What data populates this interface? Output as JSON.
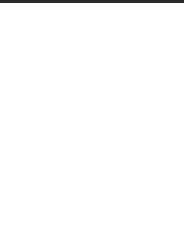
{
  "fret_label": "5 tr",
  "colors": {
    "line": "#7a7a7a",
    "dot": "#2b2b2b",
    "band": "#2a2a2a",
    "box": "#777777"
  },
  "grid": {
    "strings_x": [
      16,
      44.5,
      73,
      101.5,
      130,
      158.5
    ],
    "frets_y": [
      28,
      70,
      108,
      145,
      183,
      219
    ]
  },
  "positions": [
    {
      "row": 1,
      "y": 49,
      "marks": [
        "dot",
        "dot",
        "dot",
        "dot",
        "box",
        "dot"
      ]
    },
    {
      "row": 2,
      "y": 89,
      "marks": [
        "",
        "",
        "",
        "",
        "dot",
        ""
      ]
    },
    {
      "row": 3,
      "y": 126,
      "marks": [
        "dot",
        "box",
        "dot",
        "dot",
        "",
        "dot"
      ]
    },
    {
      "row": 4,
      "y": 164,
      "marks": [
        "dot",
        "dot",
        "",
        "",
        "dot",
        "dot"
      ]
    },
    {
      "row": 5,
      "y": 200,
      "marks": [
        "",
        "",
        "dot",
        "",
        "",
        ""
      ]
    }
  ]
}
